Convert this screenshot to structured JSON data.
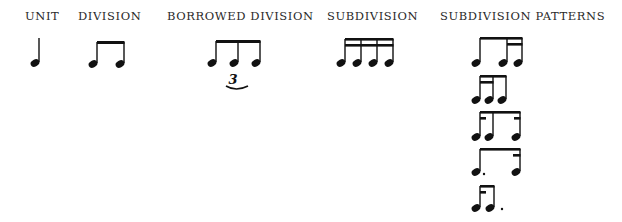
{
  "headers": [
    {
      "label": "UNIT",
      "x": 25
    },
    {
      "label": "DIVISION",
      "x": 78
    },
    {
      "label": "BORROWED DIVISION",
      "x": 167
    },
    {
      "label": "SUBDIVISION",
      "x": 327
    },
    {
      "label": "SUBDIVISION PATTERNS",
      "x": 440
    }
  ],
  "notation": {
    "ink_color": "#111111",
    "unit": {
      "description": "quarter note"
    },
    "division": {
      "description": "two beamed eighth notes"
    },
    "borrowed_division": {
      "description": "eighth-note triplet",
      "tuplet_number": "3"
    },
    "subdivision": {
      "description": "four beamed sixteenth notes"
    },
    "subdivision_patterns": [
      {
        "description": "eighth + two sixteenths"
      },
      {
        "description": "two sixteenths + eighth"
      },
      {
        "description": "sixteenth + eighth + sixteenth"
      },
      {
        "description": "dotted eighth + sixteenth"
      },
      {
        "description": "sixteenth + dotted eighth"
      }
    ]
  }
}
